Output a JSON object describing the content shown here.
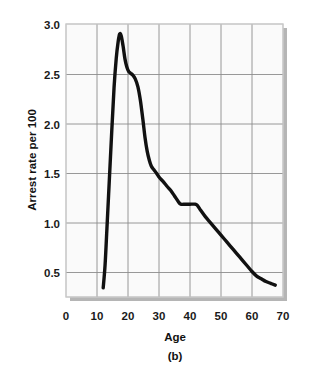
{
  "figure": {
    "panel_label": "(b)",
    "background_color": "#ffffff",
    "plot_background_color": "#fafafa",
    "plot_border_color": "#c9c9c9",
    "shadow_color": "#b5b5b5",
    "grid_color": "#8c8c8c",
    "line_color": "#111111"
  },
  "chart_data": {
    "type": "line",
    "title": "",
    "subtitle": "",
    "xlabel": "Age",
    "ylabel": "Arrest rate per 100",
    "xlim": [
      0,
      70
    ],
    "ylim": [
      0,
      3.0
    ],
    "grid": true,
    "legend": null,
    "legend_position": "none",
    "xticks": [
      0,
      10,
      20,
      30,
      40,
      50,
      60,
      70
    ],
    "xtick_labels": [
      "0",
      "10",
      "20",
      "30",
      "40",
      "50",
      "60",
      "70"
    ],
    "yticks": [
      0.5,
      1.0,
      1.5,
      2.0,
      2.5,
      3.0
    ],
    "ytick_labels": [
      "0.5",
      "1.0",
      "1.5",
      "2.0",
      "2.5",
      "3.0"
    ],
    "series": [
      {
        "name": "Arrest rate",
        "x": [
          12.0,
          12.6,
          13.2,
          14.0,
          14.8,
          15.5,
          16.2,
          16.8,
          17.3,
          17.8,
          18.4,
          19.0,
          19.6,
          20.2,
          20.8,
          21.5,
          22.3,
          23.2,
          24.0,
          24.8,
          25.5,
          26.2,
          26.9,
          27.5,
          28.3,
          29.2,
          30.2,
          31.3,
          32.5,
          33.8,
          35.0,
          36.2,
          37.0,
          38.5,
          40.0,
          41.5,
          42.3,
          43.5,
          45.0,
          46.5,
          48.0,
          50.0,
          52.0,
          54.0,
          56.0,
          58.0,
          60.0,
          61.5,
          63.0,
          64.5,
          66.0,
          67.5
        ],
        "y": [
          0.1,
          0.35,
          0.75,
          1.3,
          1.85,
          2.3,
          2.62,
          2.8,
          2.89,
          2.87,
          2.76,
          2.62,
          2.53,
          2.48,
          2.46,
          2.44,
          2.4,
          2.31,
          2.16,
          1.95,
          1.75,
          1.6,
          1.5,
          1.44,
          1.4,
          1.36,
          1.31,
          1.27,
          1.22,
          1.17,
          1.11,
          1.05,
          1.02,
          1.02,
          1.02,
          1.02,
          1.01,
          0.95,
          0.88,
          0.82,
          0.76,
          0.68,
          0.6,
          0.52,
          0.44,
          0.36,
          0.28,
          0.23,
          0.2,
          0.17,
          0.15,
          0.13
        ]
      }
    ],
    "annotations": [
      {
        "text": "peak",
        "x": 17.3,
        "y": 2.89
      },
      {
        "text": "plateau",
        "x": 39.5,
        "y": 1.02
      }
    ]
  },
  "axes": {
    "y_axis_label": "Arrest rate per 100",
    "x_axis_label": "Age"
  }
}
